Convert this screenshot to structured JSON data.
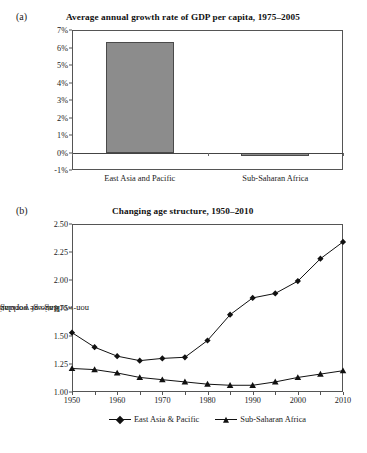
{
  "figure": {
    "panel_a_letter": "(a)",
    "panel_b_letter": "(b)"
  },
  "chart_data": [
    {
      "type": "bar",
      "panel": "(a)",
      "title": "Average annual growth rate of GDP per capita, 1975–2005",
      "xlabel": "",
      "ylabel": "",
      "categories": [
        "East Asia and Pacific",
        "Sub-Saharan Africa"
      ],
      "values": [
        6.3,
        -0.2
      ],
      "value_unit": "%",
      "ylim": [
        -1,
        7
      ],
      "yticks": [
        "7%",
        "6%",
        "5%",
        "4%",
        "3%",
        "2%",
        "1%",
        "0%",
        "-1%"
      ],
      "ytick_values": [
        7,
        6,
        5,
        4,
        3,
        2,
        1,
        0,
        -1
      ],
      "grid": false,
      "bar_color": "#8c8c8c",
      "bar_edge_color": "#4a4a4a"
    },
    {
      "type": "line",
      "panel": "(b)",
      "title": "Changing age structure, 1950–2010",
      "xlabel": "",
      "ylabel": "Ratio of working-age to non-working-age population",
      "ylabel_line1": "Ratio of working-age to",
      "ylabel_line2": "non-working-age population",
      "x": [
        1950,
        1955,
        1960,
        1965,
        1970,
        1975,
        1980,
        1985,
        1990,
        1995,
        2000,
        2005,
        2010
      ],
      "xtick_labels": [
        "1950",
        "1960",
        "1970",
        "1980",
        "1990",
        "2000",
        "2010"
      ],
      "xtick_values": [
        1950,
        1960,
        1970,
        1980,
        1990,
        2000,
        2010
      ],
      "xlim": [
        1950,
        2010
      ],
      "ylim": [
        1.0,
        2.5
      ],
      "yticks": [
        "1.00",
        "1.25",
        "1.50",
        "1.75",
        "2.00",
        "2.25",
        "2.50"
      ],
      "ytick_values": [
        1.0,
        1.25,
        1.5,
        1.75,
        2.0,
        2.25,
        2.5
      ],
      "grid": false,
      "legend_position": "bottom-center",
      "series": [
        {
          "name": "East Asia & Pacific",
          "marker": "diamond",
          "color": "#111111",
          "values": [
            1.53,
            1.4,
            1.32,
            1.28,
            1.3,
            1.31,
            1.46,
            1.69,
            1.84,
            1.88,
            1.99,
            2.19,
            2.34
          ]
        },
        {
          "name": "Sub-Saharan Africa",
          "marker": "triangle",
          "color": "#111111",
          "values": [
            1.21,
            1.2,
            1.17,
            1.13,
            1.11,
            1.09,
            1.07,
            1.06,
            1.06,
            1.09,
            1.13,
            1.16,
            1.19
          ]
        }
      ]
    }
  ]
}
